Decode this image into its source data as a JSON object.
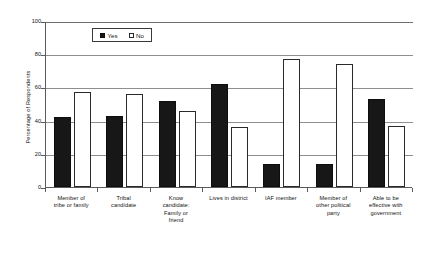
{
  "chart_data": {
    "type": "bar",
    "title": "",
    "xlabel": "",
    "ylabel": "Percentage of Respondents",
    "ylim": [
      0,
      100
    ],
    "yticks": [
      0,
      20,
      40,
      60,
      80,
      100
    ],
    "grid": true,
    "legend_position": "top-left-inside",
    "categories": [
      "Member of\ntribe or family",
      "Tribal\ncandidate",
      "Know\ncandidate:\nFamily or\nfriend",
      "Lives in district",
      "IAF member",
      "Member of\nother political\nparty",
      "Able to be\neffective with\ngovernment"
    ],
    "category_lines": [
      [
        "Member of",
        "tribe or family"
      ],
      [
        "Tribal",
        "candidate"
      ],
      [
        "Know",
        "candidate:",
        "Family or",
        "friend"
      ],
      [
        "Lives in district"
      ],
      [
        "IAF member"
      ],
      [
        "Member of",
        "other political",
        "party"
      ],
      [
        "Able to be",
        "effective with",
        "government"
      ]
    ],
    "series": [
      {
        "name": "Yes",
        "color": "#171717",
        "values": [
          42,
          43,
          52,
          62,
          14,
          14,
          53
        ]
      },
      {
        "name": "No",
        "color": "#ffffff",
        "values": [
          57,
          56,
          46,
          36,
          77,
          74,
          37
        ]
      }
    ]
  },
  "legend": {
    "entries": [
      {
        "label": "Yes",
        "style": "filled"
      },
      {
        "label": "No",
        "style": "hollow"
      }
    ]
  },
  "axis": {
    "y_tick_labels": [
      "100",
      "80",
      "60",
      "40",
      "20",
      "0"
    ],
    "y_title": "Percentage of Respondents"
  }
}
